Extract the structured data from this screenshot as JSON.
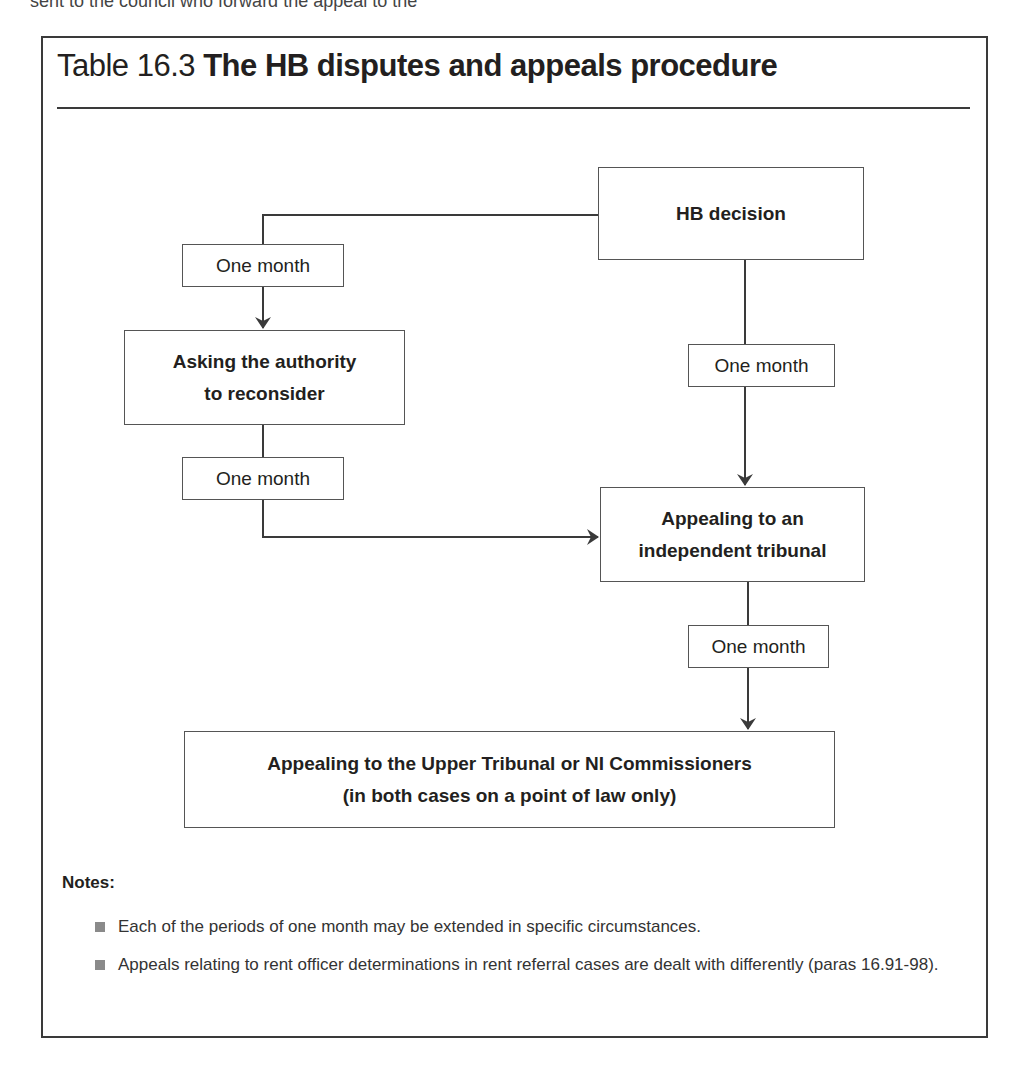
{
  "cut_off_text": "sent to the council who forward the appeal to the",
  "title": {
    "number": "Table 16.3",
    "text": "The HB disputes and appeals procedure"
  },
  "diagram": {
    "nodes": {
      "hb_decision": "HB decision",
      "reconsider_line1": "Asking the authority",
      "reconsider_line2": "to reconsider",
      "tribunal_line1": "Appealing to an",
      "tribunal_line2": "independent tribunal",
      "upper_line1": "Appealing to the Upper Tribunal or NI Commissioners",
      "upper_line2": "(in both cases on a point of law only)"
    },
    "periods": {
      "decision_to_reconsider": "One month",
      "reconsider_to_tribunal": "One month",
      "decision_to_tribunal": "One month",
      "tribunal_to_upper": "One month"
    },
    "edges": [
      {
        "from": "HB decision",
        "to": "Asking the authority to reconsider",
        "label": "One month"
      },
      {
        "from": "Asking the authority to reconsider",
        "to": "Appealing to an independent tribunal",
        "label": "One month"
      },
      {
        "from": "HB decision",
        "to": "Appealing to an independent tribunal",
        "label": "One month"
      },
      {
        "from": "Appealing to an independent tribunal",
        "to": "Appealing to the Upper Tribunal or NI Commissioners",
        "label": "One month"
      }
    ],
    "colors": {
      "line": "#3a3a3a",
      "box_border": "#555555",
      "bullet": "#8a8a8a"
    }
  },
  "notes": {
    "heading": "Notes:",
    "items": [
      "Each of the periods of one month may be extended in specific circumstances.",
      "Appeals relating to rent officer determinations in rent referral cases are dealt with differently (paras 16.91-98)."
    ]
  }
}
